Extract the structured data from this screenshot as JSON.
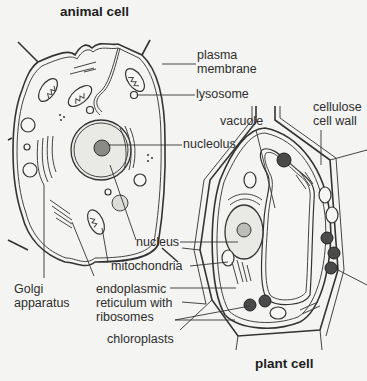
{
  "titles": {
    "animal": "animal cell",
    "plant": "plant cell"
  },
  "labels": {
    "plasma_membrane": [
      "plasma",
      "membrane"
    ],
    "lysosome": "lysosome",
    "cellulose_cell_wall": [
      "cellulose",
      "cell wall"
    ],
    "vacuole": "vacuole",
    "nucleolus": "nucleolus",
    "nucleus": "nucleus",
    "mitochondria": "mitochondria",
    "golgi_apparatus": [
      "Golgi",
      "apparatus"
    ],
    "endoplasmic_reticulum": [
      "endoplasmic",
      "reticulum with",
      "ribosomes"
    ],
    "chloroplasts": "chloroplasts"
  },
  "colors": {
    "background": "#f4f4f2",
    "ink": "#333333",
    "chloroplast_fill": "#4a4a4a"
  }
}
